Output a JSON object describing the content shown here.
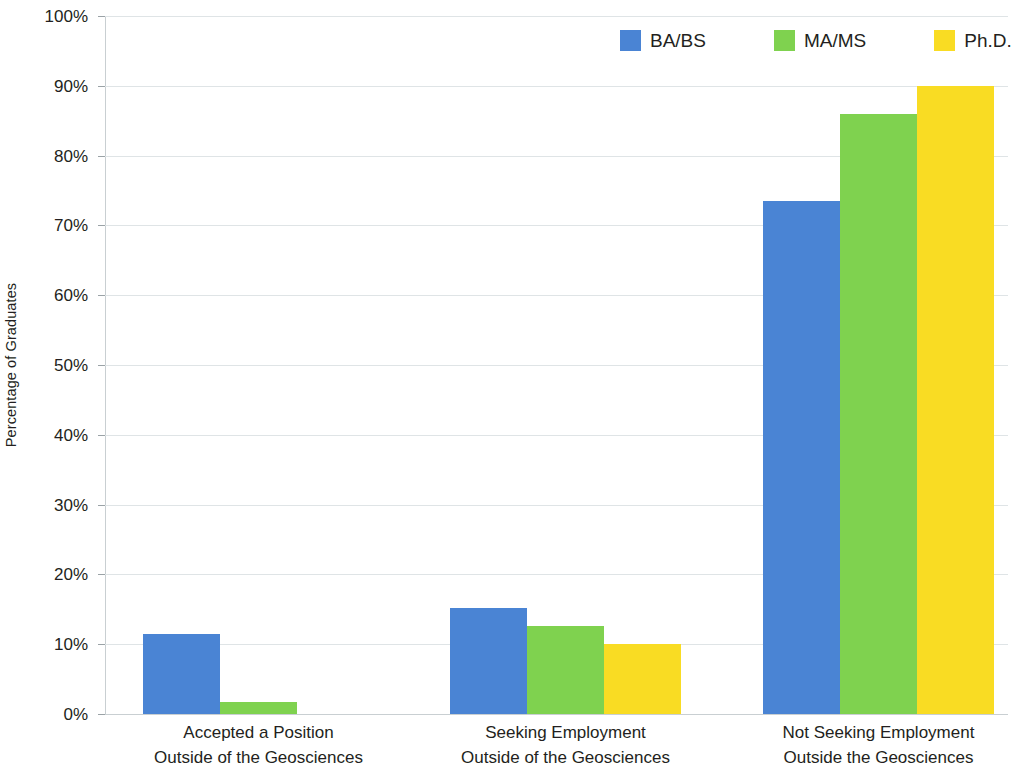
{
  "chart_data": {
    "type": "bar",
    "title": "",
    "xlabel": "",
    "ylabel": "Percentage of Graduates",
    "ylim": [
      0,
      100
    ],
    "ytick_labels": [
      "0%",
      "10%",
      "20%",
      "30%",
      "40%",
      "50%",
      "60%",
      "70%",
      "80%",
      "90%",
      "100%"
    ],
    "ytick_values": [
      0,
      10,
      20,
      30,
      40,
      50,
      60,
      70,
      80,
      90,
      100
    ],
    "grid": true,
    "legend_position": "top-right",
    "categories": [
      "Accepted a Position Outside of the Geosciences",
      "Seeking Employment Outside of the Geosciences",
      "Not Seeking Employment Outside the Geosciences"
    ],
    "category_lines": [
      [
        "Accepted a Position",
        "Outside of the Geosciences"
      ],
      [
        "Seeking Employment",
        "Outside of the Geosciences"
      ],
      [
        "Not Seeking Employment",
        "Outside the Geosciences"
      ]
    ],
    "series": [
      {
        "name": "BA/BS",
        "color": "#4a84d4",
        "values": [
          11.4,
          15.2,
          73.5
        ]
      },
      {
        "name": "MA/MS",
        "color": "#7fd24f",
        "values": [
          1.7,
          12.6,
          86.0
        ]
      },
      {
        "name": "Ph.D.",
        "color": "#f9dc23",
        "values": [
          0,
          10.1,
          90.0
        ]
      }
    ]
  },
  "legend": {
    "items": [
      {
        "label": "BA/BS",
        "color": "#4a84d4"
      },
      {
        "label": "MA/MS",
        "color": "#7fd24f"
      },
      {
        "label": "Ph.D.",
        "color": "#f9dc23"
      }
    ]
  },
  "axes": {
    "y_title": "Percentage of Graduates"
  }
}
